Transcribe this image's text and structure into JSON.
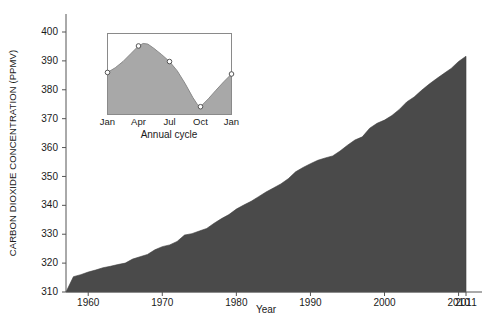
{
  "chart_data": [
    {
      "type": "area",
      "id": "main-co2-trend",
      "title": "",
      "xlabel": "Year",
      "ylabel": "CARBON DIOXIDE CONCENTRATION (PPMV)",
      "xlim": [
        1957,
        2011
      ],
      "ylim": [
        310,
        400
      ],
      "ytick_labels": [
        "310",
        "320",
        "330",
        "340",
        "350",
        "360",
        "370",
        "380",
        "390",
        "400"
      ],
      "yticks": [
        310,
        320,
        330,
        340,
        350,
        360,
        370,
        380,
        390,
        400
      ],
      "xtick_labels": [
        "1960",
        "1970",
        "1980",
        "1990",
        "2000",
        "2010",
        "2011"
      ],
      "xticks": [
        1960,
        1970,
        1980,
        1990,
        2000,
        2010,
        2011
      ],
      "grid": false,
      "legend": "none",
      "fill_color": "#4a4a4a",
      "line_color": "#3c3c3c",
      "x": [
        1957,
        1958,
        1959,
        1960,
        1961,
        1962,
        1963,
        1964,
        1965,
        1966,
        1967,
        1968,
        1969,
        1970,
        1971,
        1972,
        1973,
        1974,
        1975,
        1976,
        1977,
        1978,
        1979,
        1980,
        1981,
        1982,
        1983,
        1984,
        1985,
        1986,
        1987,
        1988,
        1989,
        1990,
        1991,
        1992,
        1993,
        1994,
        1995,
        1996,
        1997,
        1998,
        1999,
        2000,
        2001,
        2002,
        2003,
        2004,
        2005,
        2006,
        2007,
        2008,
        2009,
        2010,
        2011
      ],
      "values": [
        310.0,
        315.3,
        316.0,
        316.9,
        317.6,
        318.4,
        318.9,
        319.5,
        320.0,
        321.4,
        322.2,
        323.0,
        324.6,
        325.7,
        326.3,
        327.5,
        329.7,
        330.2,
        331.1,
        332.0,
        333.8,
        335.4,
        336.8,
        338.7,
        340.1,
        341.4,
        343.0,
        344.6,
        346.0,
        347.4,
        349.2,
        351.6,
        353.1,
        354.4,
        355.6,
        356.4,
        357.1,
        358.8,
        360.8,
        362.6,
        363.7,
        366.7,
        368.4,
        369.5,
        371.1,
        373.2,
        375.8,
        377.5,
        379.8,
        381.9,
        383.8,
        385.6,
        387.4,
        389.8,
        391.6
      ]
    },
    {
      "type": "area",
      "id": "inset-annual-cycle",
      "title": "",
      "xlabel": "Annual cycle",
      "ylabel": "",
      "xlim": [
        0,
        4
      ],
      "ylim": [
        371,
        397
      ],
      "xtick_labels": [
        "Jan",
        "Apr",
        "Jul",
        "Oct",
        "Jan"
      ],
      "xticks": [
        0,
        1,
        2,
        3,
        4
      ],
      "grid": false,
      "legend": "none",
      "fill_color": "#a8a8a8",
      "line_color": "#8a8a8a",
      "marker": "open-circle",
      "categories": [
        "Jan",
        "Apr",
        "Jul",
        "Oct",
        "Jan"
      ],
      "values": [
        384.5,
        393.0,
        388.0,
        373.5,
        384.0
      ],
      "dense_x": [
        0,
        0.25,
        0.5,
        0.75,
        1,
        1.15,
        1.3,
        1.5,
        1.75,
        2,
        2.25,
        2.5,
        2.75,
        2.9,
        3,
        3.25,
        3.5,
        3.75,
        4
      ],
      "dense_values": [
        384.5,
        386.0,
        388.0,
        390.5,
        393.0,
        393.8,
        393.6,
        392.2,
        390.2,
        388.0,
        385.0,
        381.0,
        376.5,
        374.2,
        373.5,
        376.0,
        378.8,
        381.5,
        384.0
      ]
    }
  ],
  "axes": {
    "y_title": "CARBON DIOXIDE CONCENTRATION (PPMV)",
    "x_title": "Year",
    "y_ticks": [
      "400",
      "390",
      "380",
      "370",
      "360",
      "350",
      "340",
      "330",
      "320",
      "310"
    ],
    "x_ticks": [
      "1960",
      "1970",
      "1980",
      "1990",
      "2000",
      "2010",
      "2011"
    ]
  },
  "inset": {
    "x_title": "Annual cycle",
    "x_ticks": [
      "Jan",
      "Apr",
      "Jul",
      "Oct",
      "Jan"
    ]
  },
  "colors": {
    "main_fill": "#4a4a4a",
    "inset_fill": "#a8a8a8",
    "axis": "#555555",
    "background": "#ffffff",
    "marker_fill": "#ffffff"
  }
}
